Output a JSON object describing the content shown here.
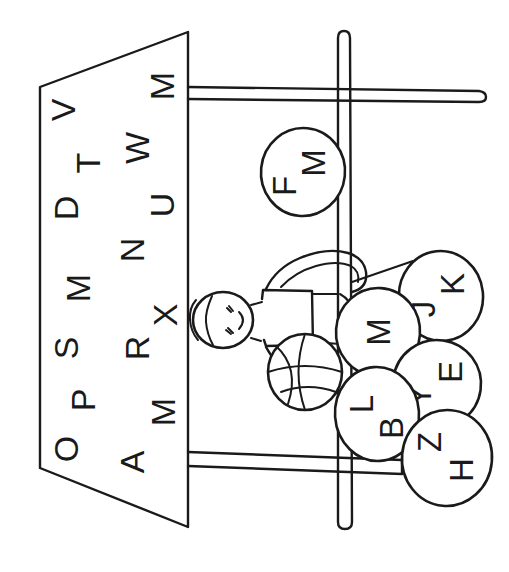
{
  "page": {
    "orientation": "rotated-90-ccw",
    "background_color": "#ffffff",
    "line_color": "#1a1a1a",
    "width": 509,
    "height": 572
  },
  "letter_board": {
    "name": "letter-board-panel",
    "shape": "trapezoid",
    "columns": [
      {
        "name": "outer-column",
        "letters": [
          "V",
          "T",
          "D",
          "M",
          "S",
          "P",
          "O"
        ]
      },
      {
        "name": "inner-column",
        "letters": [
          "M",
          "W",
          "U",
          "N",
          "X",
          "R",
          "M",
          "A"
        ]
      }
    ]
  },
  "hoop": {
    "name": "basketball-hoop-structure",
    "vertical_pole_label": "pole",
    "upper_bar_label": "backboard-arm",
    "lower_bar_label": "lower-crossbar"
  },
  "child": {
    "name": "child-figure",
    "holding": "basketball"
  },
  "balls": [
    {
      "id": "ball-fm",
      "letters": [
        "F",
        "M"
      ],
      "cx": 303,
      "cy": 172,
      "rx": 42,
      "ry": 44,
      "rot": 6
    },
    {
      "id": "ball-jk",
      "letters": [
        "J",
        "K"
      ],
      "cx": 441,
      "cy": 296,
      "rx": 42,
      "ry": 45,
      "rot": -6
    },
    {
      "id": "ball-m",
      "letters": [
        "M"
      ],
      "cx": 378,
      "cy": 332,
      "rx": 42,
      "ry": 44,
      "rot": 4
    },
    {
      "id": "ball-ye",
      "letters": [
        "Y",
        "E"
      ],
      "cx": 437,
      "cy": 384,
      "rx": 44,
      "ry": 44,
      "rot": 8
    },
    {
      "id": "ball-lb",
      "letters": [
        "L",
        "B"
      ],
      "cx": 377,
      "cy": 414,
      "rx": 42,
      "ry": 47,
      "rot": -4
    },
    {
      "id": "ball-zh",
      "letters": [
        "Z",
        "H"
      ],
      "cx": 447,
      "cy": 458,
      "rx": 45,
      "ry": 48,
      "rot": 5
    }
  ]
}
